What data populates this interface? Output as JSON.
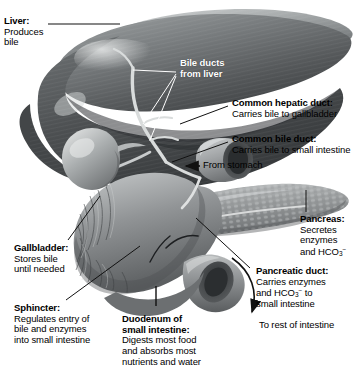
{
  "figure": {
    "organs": [
      "liver",
      "gallbladder",
      "pancreas",
      "duodenum",
      "bile ducts"
    ],
    "style": "grayscale medical illustration"
  },
  "labels": {
    "liver": {
      "header": "Liver:",
      "lines": [
        "Produces",
        "bile"
      ]
    },
    "bile_ducts": {
      "header": "Bile ducts",
      "lines": [
        "from liver"
      ]
    },
    "common_hepatic_duct": {
      "header": "Common hepatic duct:",
      "lines": [
        "Carries bile to gallbladder"
      ]
    },
    "common_bile_duct": {
      "header": "Common bile duct:",
      "lines": [
        "Carries bile to small intestine"
      ]
    },
    "from_stomach": {
      "text": "From stomach"
    },
    "pancreas": {
      "header": "Pancreas:",
      "lines": [
        "Secretes",
        "enzymes"
      ],
      "formula_line_prefix": "and HCO",
      "formula_sub": "3",
      "formula_sup": "−"
    },
    "pancreatic_duct": {
      "header": "Pancreatic duct:",
      "lines": [
        "Carries enzymes"
      ],
      "formula_line_prefix": "and HCO",
      "formula_sub": "3",
      "formula_sup": "−",
      "formula_line_suffix": " to",
      "last_line": "small intestine"
    },
    "to_rest_of_intestine": {
      "text": "To rest of intestine"
    },
    "gallbladder": {
      "header": "Gallbladder:",
      "lines": [
        "Stores bile",
        "until needed"
      ]
    },
    "sphincter": {
      "header": "Sphincter:",
      "lines": [
        "Regulates entry of",
        "bile and enzymes",
        "into small intestine"
      ]
    },
    "duodenum": {
      "header_line1": "Duodenum of",
      "header_line2": "small intestine:",
      "lines": [
        "Digests most food",
        "and absorbs most",
        "nutrients and water"
      ]
    }
  },
  "colors": {
    "background": "#ffffff",
    "text": "#000000",
    "leader_dark": "#1a1a1a",
    "leader_light": "#ffffff",
    "liver_light": "#b9bcbd",
    "liver_mid": "#8a8d8e",
    "liver_dark": "#5d6062",
    "liver_deep": "#3f4244",
    "gallbladder": "#aeb1b2",
    "pancreas": "#9b9e9f",
    "duodenum": "#93969a"
  }
}
